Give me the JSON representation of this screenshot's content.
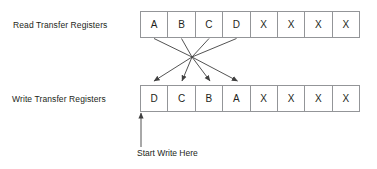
{
  "diagram": {
    "colors": {
      "text": "#231f20",
      "cell_border": "#939598",
      "arrow": "#404040",
      "background": "#ffffff"
    },
    "read_row": {
      "label": "Read Transfer Registers",
      "cells": [
        "A",
        "B",
        "C",
        "D",
        "X",
        "X",
        "X",
        "X"
      ]
    },
    "write_row": {
      "label": "Write Transfer Registers",
      "cells": [
        "D",
        "C",
        "B",
        "A",
        "X",
        "X",
        "X",
        "X"
      ]
    },
    "annotation": {
      "start_write": "Start Write Here"
    },
    "mapping": {
      "description": "Crossing arrows reverse the first four registers",
      "pairs": [
        {
          "from": "A",
          "to_index": 3
        },
        {
          "from": "B",
          "to_index": 2
        },
        {
          "from": "C",
          "to_index": 1
        },
        {
          "from": "D",
          "to_index": 0
        }
      ],
      "crossing_point": {
        "x": 192,
        "y": 57
      }
    }
  }
}
